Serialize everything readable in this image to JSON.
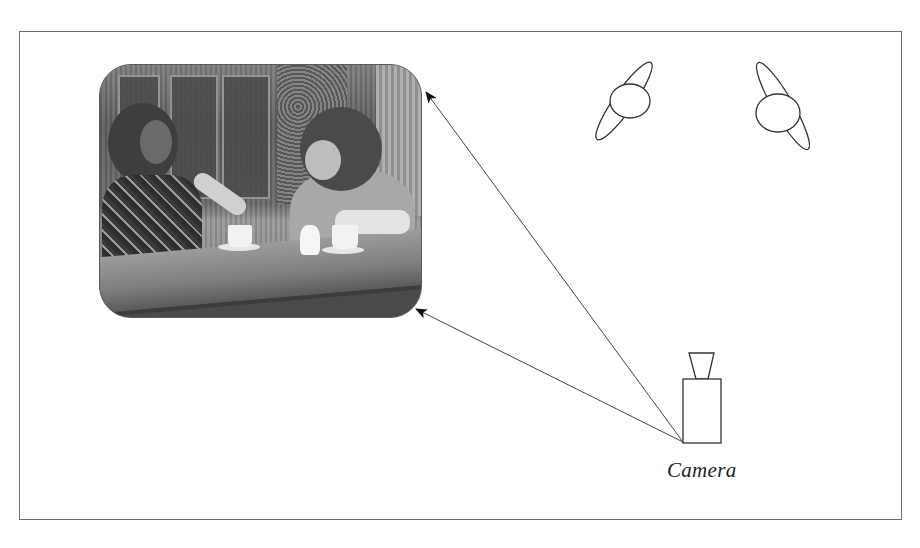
{
  "diagram": {
    "frame": {
      "stroke": "#6e6e6e"
    },
    "photo": {
      "subject": "two people talking at a cafe table with coffee cups",
      "style": "grayscale halftone",
      "corner_radius": 32
    },
    "lights": [
      {
        "name": "light-1",
        "cx": 630,
        "cy": 101
      },
      {
        "name": "light-2",
        "cx": 778,
        "cy": 112
      }
    ],
    "camera": {
      "label": "Camera"
    },
    "arrows": [
      {
        "name": "arrow-to-photo-top",
        "from": [
          683,
          442
        ],
        "to": [
          425,
          91
        ]
      },
      {
        "name": "arrow-to-photo-bottom",
        "from": [
          683,
          442
        ],
        "to": [
          415,
          309
        ]
      }
    ],
    "colors": {
      "stroke": "#444444",
      "background": "#ffffff"
    }
  }
}
